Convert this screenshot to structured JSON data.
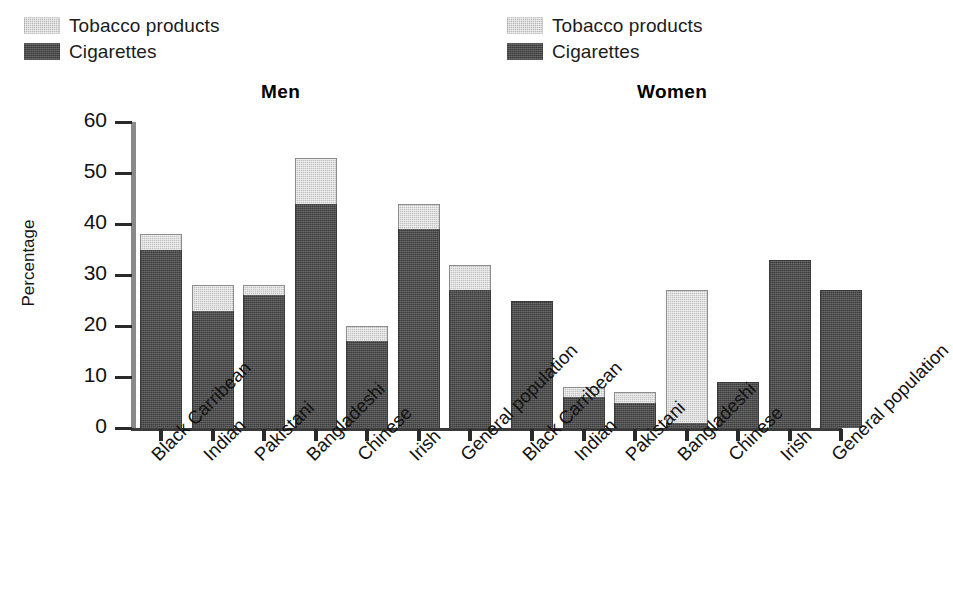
{
  "legends": [
    {
      "name": "men-legend",
      "items": [
        {
          "key": "tobacco",
          "label": "Tobacco products",
          "color": "#c2c2c2"
        },
        {
          "key": "cigarettes",
          "label": "Cigarettes",
          "color": "#4f4f4f"
        }
      ]
    },
    {
      "name": "women-legend",
      "items": [
        {
          "key": "tobacco",
          "label": "Tobacco products",
          "color": "#c2c2c2"
        },
        {
          "key": "cigarettes",
          "label": "Cigarettes",
          "color": "#4f4f4f"
        }
      ]
    }
  ],
  "groups": [
    {
      "key": "men",
      "title": "Men"
    },
    {
      "key": "women",
      "title": "Women"
    }
  ],
  "axis": {
    "ylabel": "Percentage",
    "yticks": [
      "60",
      "50",
      "40",
      "30",
      "20",
      "10",
      "0"
    ]
  },
  "chart_data": {
    "type": "bar",
    "subtype": "stacked",
    "title": "",
    "xlabel": "",
    "ylabel": "Percentage",
    "ylim": [
      0,
      60
    ],
    "ytick_values": [
      0,
      10,
      20,
      30,
      40,
      50,
      60
    ],
    "grid": false,
    "legend_position": "top-left and top-right",
    "legend_entries": [
      "Tobacco products",
      "Cigarettes"
    ],
    "panels": [
      {
        "name": "Men",
        "categories": [
          "Black Carribean",
          "Indian",
          "Pakistani",
          "Bangladeshi",
          "Chinese",
          "Irish",
          "General population"
        ],
        "series": [
          {
            "name": "Cigarettes",
            "values": [
              35,
              23,
              26,
              44,
              17,
              39,
              27
            ]
          },
          {
            "name": "Tobacco products",
            "values": [
              3,
              5,
              2,
              9,
              3,
              5,
              5
            ]
          }
        ],
        "totals": [
          38,
          28,
          28,
          53,
          20,
          44,
          32
        ]
      },
      {
        "name": "Women",
        "categories": [
          "Black Carribean",
          "Indian",
          "Pakistani",
          "Bangladeshi",
          "Chinese",
          "Irish",
          "General population"
        ],
        "series": [
          {
            "name": "Cigarettes",
            "values": [
              25,
              6,
              5,
              1,
              9,
              33,
              27
            ]
          },
          {
            "name": "Tobacco products",
            "values": [
              0,
              2,
              2,
              26,
              0,
              0,
              0
            ]
          }
        ],
        "totals": [
          25,
          8,
          7,
          27,
          9,
          33,
          27
        ]
      }
    ]
  }
}
